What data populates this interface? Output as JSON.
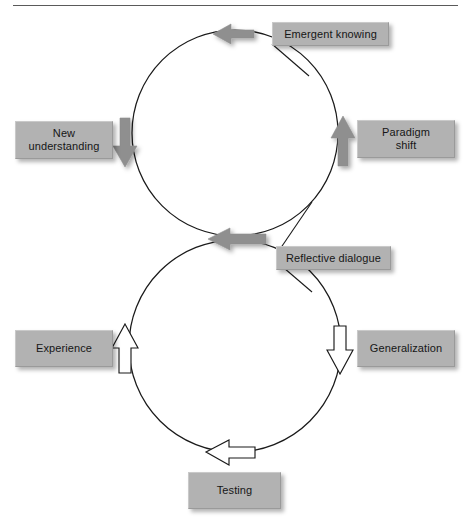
{
  "figure": {
    "type": "cycle-diagram",
    "header_rule": true
  },
  "colors": {
    "box_fill": "#b2b2b2",
    "box_text": "#161616",
    "solid_arrow_fill": "#8f8f8f",
    "hollow_arrow_fill": "#ffffff",
    "stroke": "#1a1a1a",
    "rule": "#5a5a5a",
    "page_background": "#ffffff"
  },
  "cycles": [
    {
      "name": "upper-cycle",
      "arrow_style": "solid-gray",
      "direction": "counterclockwise",
      "nodes": [
        "Emergent knowing",
        "New understanding",
        "Reflective dialogue",
        "Paradigm shift"
      ]
    },
    {
      "name": "lower-cycle",
      "arrow_style": "hollow-white",
      "direction": "clockwise",
      "nodes": [
        "Reflective dialogue",
        "Generalization",
        "Testing",
        "Experience"
      ]
    }
  ],
  "nodes": {
    "emergent_knowing": "Emergent knowing",
    "new_understanding": "New\nunderstanding",
    "paradigm_shift": "Paradigm\nshift",
    "reflective_dialogue": "Reflective dialogue",
    "experience": "Experience",
    "generalization": "Generalization",
    "testing": "Testing"
  },
  "arrows": [
    {
      "name": "arrow-top-left",
      "style": "solid-gray",
      "direction": "left",
      "cycle": "upper-cycle"
    },
    {
      "name": "arrow-left-down",
      "style": "solid-gray",
      "direction": "down",
      "cycle": "upper-cycle"
    },
    {
      "name": "arrow-middle-left",
      "style": "solid-gray",
      "direction": "left",
      "cycle": "upper-cycle"
    },
    {
      "name": "arrow-right-up",
      "style": "solid-gray",
      "direction": "up",
      "cycle": "upper-cycle"
    },
    {
      "name": "arrow-right-down",
      "style": "hollow-white",
      "direction": "down",
      "cycle": "lower-cycle"
    },
    {
      "name": "arrow-bottom-left",
      "style": "hollow-white",
      "direction": "left",
      "cycle": "lower-cycle"
    },
    {
      "name": "arrow-left-up",
      "style": "hollow-white",
      "direction": "up",
      "cycle": "lower-cycle"
    }
  ]
}
